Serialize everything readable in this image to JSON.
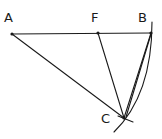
{
  "diagram": {
    "type": "geometric-construction",
    "points": [
      {
        "id": "A",
        "label": "A",
        "x": 12,
        "y": 34,
        "label_x": 4,
        "label_y": 22
      },
      {
        "id": "F",
        "label": "F",
        "x": 98,
        "y": 33,
        "label_x": 91,
        "label_y": 22
      },
      {
        "id": "B",
        "label": "B",
        "x": 151,
        "y": 33,
        "label_x": 138,
        "label_y": 22
      },
      {
        "id": "C",
        "label": "C",
        "x": 124,
        "y": 118,
        "label_x": 101,
        "label_y": 123
      }
    ],
    "segments": [
      {
        "from": "A",
        "to": "B"
      },
      {
        "from": "A",
        "to": "C"
      },
      {
        "from": "F",
        "to": "C"
      },
      {
        "from": "B",
        "to": "C"
      }
    ],
    "arcs": [
      {
        "description": "arc through B and C",
        "path": "M152 22 Q150 100 113 132"
      }
    ],
    "colors": {
      "stroke": "#1a1a1a",
      "background": "#ffffff"
    }
  }
}
